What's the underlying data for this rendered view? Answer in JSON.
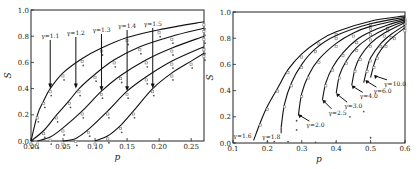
{
  "chart_data": [
    {
      "type": "line",
      "panel": "left",
      "title": "",
      "xlabel": "p",
      "ylabel": "S",
      "xlim": [
        0.0,
        0.27
      ],
      "ylim": [
        0.0,
        1.0
      ],
      "xticks": [
        "0.00",
        "0.05",
        "0.10",
        "0.15",
        "0.20",
        "0.25"
      ],
      "yticks": [
        "0.0",
        "0.2",
        "0.4",
        "0.6",
        "0.8",
        "1.0"
      ],
      "grid": false,
      "series": [
        {
          "name": "γ=1.1",
          "pc": 0.0,
          "x": [
            0.0,
            0.01,
            0.02,
            0.03,
            0.05,
            0.08,
            0.11,
            0.15,
            0.2,
            0.27
          ],
          "y": [
            0.0,
            0.2,
            0.31,
            0.4,
            0.52,
            0.63,
            0.71,
            0.79,
            0.85,
            0.91
          ]
        },
        {
          "name": "γ=1.2",
          "pc": 0.0,
          "x": [
            0.0,
            0.02,
            0.04,
            0.06,
            0.075,
            0.1,
            0.13,
            0.17,
            0.22,
            0.27
          ],
          "y": [
            0.0,
            0.08,
            0.2,
            0.31,
            0.4,
            0.51,
            0.62,
            0.72,
            0.8,
            0.86
          ]
        },
        {
          "name": "γ=1.3",
          "pc": 0.01,
          "x": [
            0.01,
            0.03,
            0.05,
            0.08,
            0.11,
            0.14,
            0.18,
            0.22,
            0.27
          ],
          "y": [
            0.0,
            0.03,
            0.1,
            0.23,
            0.38,
            0.5,
            0.62,
            0.71,
            0.8
          ]
        },
        {
          "name": "γ=1.4",
          "pc": 0.05,
          "x": [
            0.05,
            0.07,
            0.09,
            0.12,
            0.15,
            0.18,
            0.22,
            0.27
          ],
          "y": [
            0.0,
            0.02,
            0.09,
            0.23,
            0.38,
            0.49,
            0.61,
            0.72
          ]
        },
        {
          "name": "γ=1.5",
          "pc": 0.1,
          "x": [
            0.1,
            0.12,
            0.14,
            0.16,
            0.19,
            0.22,
            0.25,
            0.27
          ],
          "y": [
            0.0,
            0.04,
            0.12,
            0.23,
            0.4,
            0.52,
            0.61,
            0.67
          ]
        }
      ],
      "annotations": [
        {
          "text": "γ=1.1",
          "arrow_to": [
            0.03,
            0.4
          ]
        },
        {
          "text": "γ=1.2",
          "arrow_to": [
            0.07,
            0.4
          ]
        },
        {
          "text": "γ=1.3",
          "arrow_to": [
            0.11,
            0.38
          ]
        },
        {
          "text": "γ=1.4",
          "arrow_to": [
            0.15,
            0.38
          ]
        },
        {
          "text": "γ=1.5",
          "arrow_to": [
            0.19,
            0.4
          ]
        }
      ]
    },
    {
      "type": "line",
      "panel": "right",
      "title": "",
      "xlabel": "p",
      "ylabel": "S",
      "xlim": [
        0.1,
        0.6
      ],
      "ylim": [
        0.0,
        1.0
      ],
      "xticks": [
        "0.1",
        "0.2",
        "0.3",
        "0.4",
        "0.5",
        "0.6"
      ],
      "yticks": [
        "0.0",
        "0.2",
        "0.4",
        "0.6",
        "0.8",
        "1.0"
      ],
      "grid": false,
      "series": [
        {
          "name": "γ=1.6",
          "x": [
            0.16,
            0.18,
            0.2,
            0.23,
            0.26,
            0.3,
            0.35,
            0.4,
            0.5,
            0.6
          ],
          "y": [
            0.02,
            0.16,
            0.28,
            0.42,
            0.56,
            0.68,
            0.78,
            0.85,
            0.93,
            0.97
          ]
        },
        {
          "name": "γ=1.8",
          "x": [
            0.24,
            0.25,
            0.27,
            0.3,
            0.34,
            0.4,
            0.5,
            0.6
          ],
          "y": [
            0.12,
            0.3,
            0.46,
            0.6,
            0.72,
            0.82,
            0.91,
            0.96
          ]
        },
        {
          "name": "γ=2.0",
          "x": [
            0.29,
            0.3,
            0.32,
            0.35,
            0.4,
            0.45,
            0.5,
            0.6
          ],
          "y": [
            0.21,
            0.38,
            0.52,
            0.64,
            0.76,
            0.84,
            0.89,
            0.95
          ]
        },
        {
          "name": "γ=2.5",
          "x": [
            0.36,
            0.37,
            0.39,
            0.42,
            0.46,
            0.5,
            0.55,
            0.6
          ],
          "y": [
            0.33,
            0.46,
            0.58,
            0.69,
            0.79,
            0.85,
            0.9,
            0.94
          ]
        },
        {
          "name": "γ=3.0",
          "x": [
            0.4,
            0.41,
            0.43,
            0.46,
            0.5,
            0.55,
            0.6
          ],
          "y": [
            0.38,
            0.52,
            0.63,
            0.73,
            0.81,
            0.88,
            0.93
          ]
        },
        {
          "name": "γ=4.0",
          "x": [
            0.445,
            0.455,
            0.47,
            0.5,
            0.54,
            0.6
          ],
          "y": [
            0.44,
            0.57,
            0.66,
            0.76,
            0.84,
            0.92
          ]
        },
        {
          "name": "γ=6.0",
          "x": [
            0.48,
            0.49,
            0.5,
            0.53,
            0.56,
            0.6
          ],
          "y": [
            0.46,
            0.57,
            0.65,
            0.76,
            0.83,
            0.9
          ]
        },
        {
          "name": "γ=10.0",
          "x": [
            0.5,
            0.51,
            0.52,
            0.545,
            0.57,
            0.6
          ],
          "y": [
            0.5,
            0.6,
            0.67,
            0.76,
            0.82,
            0.88
          ]
        }
      ],
      "scatter_extra": [
        {
          "x": 0.285,
          "y": 0.17
        },
        {
          "x": 0.285,
          "y": 0.1
        },
        {
          "x": 0.44,
          "y": 0.2
        },
        {
          "x": 0.48,
          "y": 0.24
        },
        {
          "x": 0.5,
          "y": 0.04
        },
        {
          "x": 0.2,
          "y": 0.01
        },
        {
          "x": 0.22,
          "y": 0.01
        },
        {
          "x": 0.26,
          "y": 0.01
        },
        {
          "x": 0.34,
          "y": 0.005
        },
        {
          "x": 0.4,
          "y": 0.005
        }
      ],
      "annotations": [
        {
          "text": "γ=1.6",
          "arrow_to": [
            0.165,
            0.05
          ]
        },
        {
          "text": "γ=1.8",
          "arrow_to": [
            0.24,
            0.12
          ]
        },
        {
          "text": "γ=2.0",
          "arrow_to": [
            0.29,
            0.22
          ]
        },
        {
          "text": "γ=2.5",
          "arrow_to": [
            0.36,
            0.33
          ]
        },
        {
          "text": "γ=3.0",
          "arrow_to": [
            0.4,
            0.38
          ]
        },
        {
          "text": "γ=4.0",
          "arrow_to": [
            0.445,
            0.44
          ]
        },
        {
          "text": "γ=6.0",
          "arrow_to": [
            0.485,
            0.48
          ]
        },
        {
          "text": "γ=10.0",
          "arrow_to": [
            0.51,
            0.52
          ]
        }
      ]
    }
  ]
}
